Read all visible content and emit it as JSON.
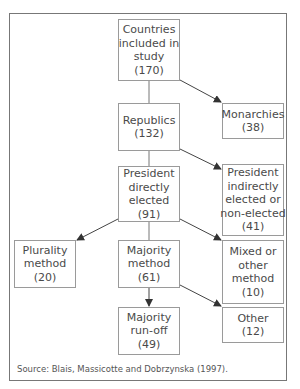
{
  "diagram": {
    "type": "flowchart",
    "nodes": {
      "countries": {
        "lines": [
          "Countries",
          "included in",
          "study",
          "(170)"
        ],
        "label": "Countries included in study",
        "count": 170
      },
      "republics": {
        "lines": [
          "Republics",
          "(132)"
        ],
        "label": "Republics",
        "count": 132
      },
      "monarchies": {
        "lines": [
          "Monarchies",
          "(38)"
        ],
        "label": "Monarchies",
        "count": 38
      },
      "president_direct": {
        "lines": [
          "President",
          "directly",
          "elected",
          "(91)"
        ],
        "label": "President directly elected",
        "count": 91
      },
      "president_indirect": {
        "lines": [
          "President",
          "indirectly",
          "elected or",
          "non-elected",
          "(41)"
        ],
        "label": "President indirectly elected or non-elected",
        "count": 41
      },
      "plurality": {
        "lines": [
          "Plurality",
          "method",
          "(20)"
        ],
        "label": "Plurality method",
        "count": 20
      },
      "majority": {
        "lines": [
          "Majority",
          "method",
          "(61)"
        ],
        "label": "Majority method",
        "count": 61
      },
      "mixed": {
        "lines": [
          "Mixed or",
          "other",
          "method",
          "(10)"
        ],
        "label": "Mixed or other method",
        "count": 10
      },
      "runoff": {
        "lines": [
          "Majority",
          "run-off",
          "(49)"
        ],
        "label": "Majority run-off",
        "count": 49
      },
      "other": {
        "lines": [
          "Other",
          "(12)"
        ],
        "label": "Other",
        "count": 12
      }
    },
    "edges": [
      {
        "from": "countries",
        "to": "republics",
        "style": "line"
      },
      {
        "from": "countries",
        "to": "monarchies",
        "style": "arrow"
      },
      {
        "from": "republics",
        "to": "president_direct",
        "style": "line"
      },
      {
        "from": "republics",
        "to": "president_indirect",
        "style": "arrow"
      },
      {
        "from": "president_direct",
        "to": "plurality",
        "style": "arrow"
      },
      {
        "from": "president_direct",
        "to": "majority",
        "style": "line"
      },
      {
        "from": "president_direct",
        "to": "mixed",
        "style": "arrow"
      },
      {
        "from": "majority",
        "to": "runoff",
        "style": "arrow"
      },
      {
        "from": "majority",
        "to": "other",
        "style": "arrow"
      }
    ],
    "source": "Source:  Blais, Massicotte and Dobrzynska (1997)."
  },
  "colors": {
    "border": "#9a9a9a",
    "frame": "#777777",
    "text": "#4a4a4a",
    "arrow": "#333333"
  }
}
